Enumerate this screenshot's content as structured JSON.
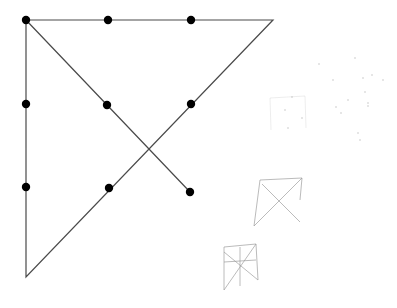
{
  "diagram": {
    "title": "",
    "type": "nine-dot-puzzle",
    "colors": {
      "background": "#ffffff",
      "line": "#4a4a4a",
      "dot": "#000000",
      "sketch": "#9a9a9a",
      "speck": "#b0b0b0"
    },
    "dots": [
      {
        "x": 26,
        "y": 20
      },
      {
        "x": 108,
        "y": 20
      },
      {
        "x": 191,
        "y": 20
      },
      {
        "x": 26,
        "y": 104
      },
      {
        "x": 107,
        "y": 105
      },
      {
        "x": 191,
        "y": 104
      },
      {
        "x": 26,
        "y": 187
      },
      {
        "x": 109,
        "y": 188
      },
      {
        "x": 190,
        "y": 192
      }
    ],
    "path": [
      {
        "x": 190,
        "y": 192
      },
      {
        "x": 26,
        "y": 20
      },
      {
        "x": 273,
        "y": 20
      },
      {
        "x": 26,
        "y": 277
      },
      {
        "x": 26,
        "y": 20
      }
    ],
    "sketches": [
      {
        "name": "sketch-small-triangle",
        "lines": [
          [
            [
              260,
              180
            ],
            [
              302,
              178
            ]
          ],
          [
            [
              260,
              180
            ],
            [
              254,
              226
            ]
          ],
          [
            [
              254,
              226
            ],
            [
              302,
              178
            ]
          ],
          [
            [
              262,
              184
            ],
            [
              300,
              222
            ]
          ],
          [
            [
              302,
              178
            ],
            [
              300,
              200
            ]
          ]
        ]
      },
      {
        "name": "sketch-small-grid",
        "lines": [
          [
            [
              224,
              247
            ],
            [
              256,
              244
            ]
          ],
          [
            [
              224,
              247
            ],
            [
              224,
              290
            ]
          ],
          [
            [
              240,
              247
            ],
            [
              240,
              286
            ]
          ],
          [
            [
              256,
              244
            ],
            [
              258,
              280
            ]
          ],
          [
            [
              224,
              262
            ],
            [
              256,
              260
            ]
          ],
          [
            [
              224,
              290
            ],
            [
              256,
              244
            ]
          ],
          [
            [
              224,
              252
            ],
            [
              258,
              280
            ]
          ]
        ]
      },
      {
        "name": "sketch-faint-marks",
        "lines": [
          [
            [
              270,
              98
            ],
            [
              305,
              96
            ]
          ],
          [
            [
              270,
              98
            ],
            [
              271,
              130
            ]
          ],
          [
            [
              305,
              96
            ],
            [
              306,
              128
            ]
          ]
        ]
      }
    ],
    "specks": [
      {
        "x": 355,
        "y": 58
      },
      {
        "x": 363,
        "y": 78
      },
      {
        "x": 372,
        "y": 75
      },
      {
        "x": 383,
        "y": 80
      },
      {
        "x": 365,
        "y": 92
      },
      {
        "x": 368,
        "y": 106
      },
      {
        "x": 348,
        "y": 100
      },
      {
        "x": 368,
        "y": 103
      },
      {
        "x": 333,
        "y": 80
      },
      {
        "x": 319,
        "y": 64
      },
      {
        "x": 336,
        "y": 107
      },
      {
        "x": 358,
        "y": 133
      },
      {
        "x": 360,
        "y": 140
      },
      {
        "x": 285,
        "y": 110
      },
      {
        "x": 292,
        "y": 97
      },
      {
        "x": 302,
        "y": 118
      },
      {
        "x": 288,
        "y": 128
      },
      {
        "x": 341,
        "y": 113
      }
    ]
  }
}
